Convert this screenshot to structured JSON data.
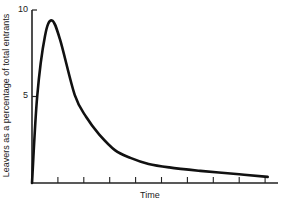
{
  "chart_data": {
    "type": "line",
    "title": "",
    "xlabel": "Time",
    "ylabel": "Leavers as a percentage of total entrants",
    "ylim": [
      0,
      10
    ],
    "yticks": [
      5,
      10
    ],
    "ytick_labels": [
      "5",
      "10"
    ],
    "xlim": [
      0,
      9.5
    ],
    "xticks": [
      1,
      2,
      3,
      4,
      5,
      6,
      7,
      8,
      9
    ],
    "xtick_labels": [],
    "grid": false,
    "legend": null,
    "series": [
      {
        "name": "Leavers",
        "x": [
          0,
          0.2,
          0.5,
          0.77,
          1.08,
          1.65,
          2.1,
          2.6,
          3.2,
          3.8,
          4.5,
          5.3,
          6.5,
          8.0,
          9.1
        ],
        "values": [
          0,
          5,
          8.5,
          9.4,
          8.3,
          5.1,
          3.8,
          2.8,
          1.9,
          1.45,
          1.1,
          0.9,
          0.7,
          0.5,
          0.35
        ]
      }
    ]
  },
  "colors": {
    "line": "#111111",
    "axis": "#222222",
    "background": "#ffffff"
  }
}
